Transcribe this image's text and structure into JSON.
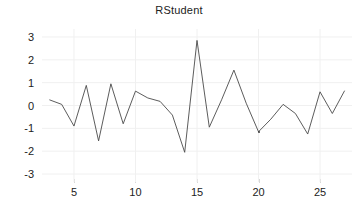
{
  "chart_data": {
    "type": "line",
    "title": "RStudent",
    "xlabel": "",
    "ylabel": "",
    "xlim": [
      2.4,
      27.6
    ],
    "ylim": [
      -3.35,
      3.35
    ],
    "grid": true,
    "legend": "none",
    "line_color": "#4a4a4a",
    "grid_color": "#f0f0f0",
    "background": "#ffffff",
    "text_color": "#222222",
    "xticks": [
      5,
      10,
      15,
      20,
      25
    ],
    "yticks": [
      3,
      2,
      1,
      0,
      -1,
      -2,
      -3
    ],
    "xtick_labels": [
      "5",
      "10",
      "15",
      "20",
      "25"
    ],
    "ytick_labels": [
      "3",
      "2",
      "1",
      "0",
      "-1",
      "-2",
      "-3"
    ],
    "x": [
      3,
      4,
      5,
      6,
      7,
      8,
      9,
      10,
      11,
      12,
      13,
      14,
      15,
      16,
      17,
      18,
      19,
      20,
      21,
      22,
      23,
      24,
      25,
      26,
      27
    ],
    "values": [
      0.25,
      0.05,
      -0.9,
      0.88,
      -1.55,
      0.95,
      -0.8,
      0.63,
      0.33,
      0.18,
      -0.42,
      -2.05,
      2.85,
      -0.95,
      0.25,
      1.55,
      0.1,
      -1.15,
      -0.6,
      0.05,
      -0.35,
      -1.25,
      0.6,
      -0.35,
      0.65
    ],
    "markers": [
      {
        "x": 20,
        "y": -1.15
      }
    ]
  }
}
